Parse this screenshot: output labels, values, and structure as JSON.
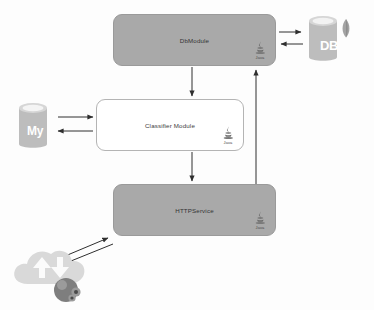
{
  "diagram": {
    "type": "architecture-diagram",
    "background_color": "#fdfdfd",
    "module_fill_color": "#a9a9a9",
    "module_border_color": "#9a9a9a",
    "edge_color": "#3a3a3a",
    "datastore_color": "#b8b8b8"
  },
  "modules": [
    {
      "id": "dbmodule",
      "label": "DbModule",
      "style": "filled",
      "runtime": "Java",
      "x": 113,
      "y": 14,
      "w": 163,
      "h": 52
    },
    {
      "id": "classifier",
      "label": "Classifier Module",
      "style": "hollow",
      "runtime": "Java",
      "x": 96,
      "y": 99,
      "w": 148,
      "h": 52
    },
    {
      "id": "httpservice",
      "label": "HTTPService",
      "style": "filled",
      "runtime": "Java",
      "x": 113,
      "y": 184,
      "w": 163,
      "h": 52
    }
  ],
  "datastores": [
    {
      "id": "mongodb",
      "label": "DB",
      "icon": "database-cylinder-leaf-icon",
      "x": 305,
      "y": 11,
      "w": 48,
      "h": 58
    },
    {
      "id": "mysql",
      "label": "My",
      "icon": "database-cylinder-icon",
      "x": 14,
      "y": 98,
      "w": 42,
      "h": 56
    }
  ],
  "external": [
    {
      "id": "cloud-crawler",
      "label": "",
      "icon": "cloud-sync-spider-icon"
    }
  ],
  "edges": [
    {
      "id": "dbmodule-to-mongodb",
      "from": "dbmodule",
      "to": "mongodb",
      "direction": "right"
    },
    {
      "id": "mongodb-to-dbmodule",
      "from": "mongodb",
      "to": "dbmodule",
      "direction": "left"
    },
    {
      "id": "mysql-to-classifier",
      "from": "mysql",
      "to": "classifier",
      "direction": "right"
    },
    {
      "id": "classifier-to-mysql",
      "from": "classifier",
      "to": "mysql",
      "direction": "left"
    },
    {
      "id": "dbmodule-to-classifier",
      "from": "dbmodule",
      "to": "classifier",
      "direction": "down"
    },
    {
      "id": "classifier-to-httpservice",
      "from": "classifier",
      "to": "httpservice",
      "direction": "down"
    },
    {
      "id": "httpservice-to-dbmodule",
      "from": "httpservice",
      "to": "dbmodule",
      "direction": "up"
    },
    {
      "id": "cloud-to-httpservice",
      "from": "cloud-crawler",
      "to": "httpservice",
      "direction": "up-right"
    },
    {
      "id": "httpservice-to-cloud",
      "from": "httpservice",
      "to": "cloud-crawler",
      "direction": "down-left"
    }
  ],
  "java_badge": {
    "word": "Java"
  }
}
